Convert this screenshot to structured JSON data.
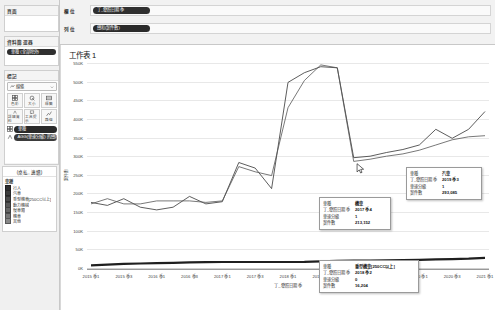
{
  "app": {
    "worksheet_title": "工作表 1"
  },
  "pages_card": {
    "title": "頁面"
  },
  "filters_card": {
    "title": "資料篩選器",
    "pills": [
      "車種 (全部除外)"
    ]
  },
  "marks_card": {
    "title": "標記",
    "mark_type": "線條",
    "buttons": [
      {
        "label": "色彩",
        "icon": "color-icon"
      },
      {
        "label": "大小",
        "icon": "size-icon"
      },
      {
        "label": "標籤",
        "icon": "label-icon"
      },
      {
        "label": "詳細資料",
        "icon": "detail-icon"
      },
      {
        "label": "工具提示",
        "icon": "tooltip-icon"
      },
      {
        "label": "路徑",
        "icon": "path-icon"
      }
    ],
    "encodings": [
      {
        "icon": "color-encoding-icon",
        "pill": "車種"
      },
      {
        "icon": "detail-encoding-icon",
        "pill": "AGG(車速分級) 的總和"
      }
    ]
  },
  "legend": {
    "title": "(桌払, 連續)",
    "field": "車種",
    "items": [
      {
        "label": "行人",
        "color": "#2f2f2f"
      },
      {
        "label": "汽車",
        "color": "#3c3c3c"
      },
      {
        "label": "重型機車[250CC以上]",
        "color": "#4a4a4a"
      },
      {
        "label": "動力機械",
        "color": "#585858"
      },
      {
        "label": "慢車類",
        "color": "#666666"
      },
      {
        "label": "機車",
        "color": "#777777"
      },
      {
        "label": "其他",
        "color": "#888888"
      }
    ]
  },
  "shelves": [
    {
      "label": "欄 位",
      "pill": "丁_發照日期 季"
    },
    {
      "label": "列 位",
      "pill": "總和(案件數)"
    }
  ],
  "chart_data": {
    "type": "line",
    "title": "工作表 1",
    "xlabel": "丁_發照日期 季",
    "ylabel": "案件數",
    "ylim": [
      0,
      550000
    ],
    "ytick_labels": [
      "0K",
      "50K",
      "100K",
      "150K",
      "200K",
      "250K",
      "300K",
      "350K",
      "400K",
      "450K",
      "500K",
      "550K"
    ],
    "ytick_values": [
      0,
      50000,
      100000,
      150000,
      200000,
      250000,
      300000,
      350000,
      400000,
      450000,
      500000,
      550000
    ],
    "grid": true,
    "legend_position": "left",
    "x": [
      "2015 季1",
      "2015 季2",
      "2015 季3",
      "2015 季4",
      "2016 季1",
      "2016 季2",
      "2016 季3",
      "2016 季4",
      "2017 季1",
      "2017 季2",
      "2017 季3",
      "2017 季4",
      "2018 季1",
      "2018 季2",
      "2018 季3",
      "2018 季4",
      "2019 季1",
      "2019 季2",
      "2019 季3",
      "2019 季4",
      "2020 季1",
      "2020 季2",
      "2020 季3",
      "2020 季4",
      "2021 季1"
    ],
    "xtick_labels": [
      "2015 季1",
      "2015 季3",
      "2016 季1",
      "2016 季3",
      "2017 季1",
      "2017 季3",
      "2018 季1",
      "2018 季3",
      "2019 季1",
      "2019 季3",
      "2020 季1",
      "2020 季3",
      "2021 季1"
    ],
    "xtick_indices": [
      0,
      2,
      4,
      6,
      8,
      10,
      12,
      14,
      16,
      18,
      20,
      22,
      24
    ],
    "series": [
      {
        "name": "機車",
        "color": "#333333",
        "values": [
          176000,
          168000,
          186000,
          163000,
          156000,
          163000,
          192000,
          172000,
          178000,
          283000,
          268000,
          213152,
          498000,
          524000,
          540000,
          537000,
          296000,
          300000,
          310000,
          318000,
          330000,
          372000,
          348000,
          372000,
          420000
        ]
      },
      {
        "name": "汽車",
        "color": "#555555",
        "values": [
          172000,
          186000,
          172000,
          172000,
          180000,
          180000,
          180000,
          176000,
          180000,
          272000,
          258000,
          248000,
          430000,
          503000,
          545000,
          537000,
          286000,
          292000,
          300000,
          306000,
          316000,
          330000,
          344000,
          352000,
          355000
        ]
      },
      {
        "name": "重型機車[250CC以上]",
        "color": "#1f1f1f",
        "values": [
          7000,
          9000,
          11000,
          12000,
          13000,
          14000,
          15000,
          15500,
          16000,
          16100,
          16150,
          16200,
          16204,
          16300,
          18000,
          19000,
          19500,
          20000,
          20500,
          21000,
          22000,
          23000,
          24000,
          25000,
          27000
        ]
      }
    ],
    "tooltips": [
      {
        "id": "tooltip-motorcycle",
        "rows": [
          {
            "key": "車種",
            "value": "機車"
          },
          {
            "key": "丁_發照日期 季",
            "value": "2017 季4"
          },
          {
            "key": "車速分級",
            "value": "1"
          },
          {
            "key": "案件數",
            "value": "213,152"
          }
        ]
      },
      {
        "id": "tooltip-car",
        "rows": [
          {
            "key": "車種",
            "value": "汽車"
          },
          {
            "key": "丁_發照日期 季",
            "value": "2019 季3"
          },
          {
            "key": "車速分級",
            "value": "1"
          },
          {
            "key": "案件數",
            "value": "293,085"
          }
        ]
      },
      {
        "id": "tooltip-heavy-motorcycle",
        "rows": [
          {
            "key": "車種",
            "value": "重型機車[250CC以上]"
          },
          {
            "key": "丁_發照日期 季",
            "value": "2018 季2"
          },
          {
            "key": "車速分級",
            "value": "0"
          },
          {
            "key": "案件數",
            "value": "16,204"
          }
        ]
      }
    ]
  }
}
